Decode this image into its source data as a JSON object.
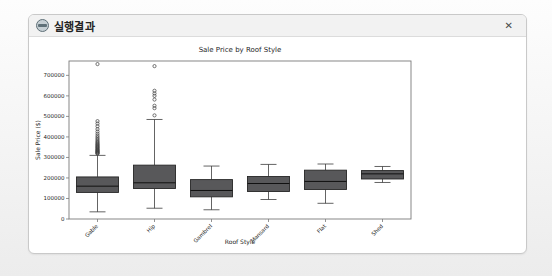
{
  "window": {
    "title": "실행결과",
    "close_glyph": "✕",
    "icon_name": "app-logo-icon"
  },
  "chart_data": {
    "type": "boxplot",
    "title": "Sale Price by Roof Style",
    "xlabel": "Roof Style",
    "ylabel": "Sale Price ($)",
    "categories": [
      "Gable",
      "Hip",
      "Gambrel",
      "Mansard",
      "Flat",
      "Shed"
    ],
    "ylim": [
      0,
      770000
    ],
    "yticks": [
      0,
      100000,
      200000,
      300000,
      400000,
      500000,
      600000,
      700000
    ],
    "grid": false,
    "legend": "none",
    "box_fill_color": "#58585a",
    "box_edge_color": "#262626",
    "median_color": "#111111",
    "whisker_color": "#3c3c3c",
    "axis_color": "#7a7a7a",
    "series": [
      {
        "label": "Gable",
        "whislo": 34900,
        "q1": 129500,
        "med": 160000,
        "q3": 205000,
        "whishi": 310000,
        "outliers": [
          318000,
          320000,
          323000,
          326000,
          328000,
          331000,
          334000,
          337000,
          340000,
          344000,
          348000,
          351000,
          355000,
          359000,
          363000,
          367000,
          372000,
          377000,
          383000,
          390000,
          397000,
          405000,
          415000,
          426000,
          438000,
          452000,
          465000,
          477000,
          755000
        ]
      },
      {
        "label": "Hip",
        "whislo": 52500,
        "q1": 148500,
        "med": 176500,
        "q3": 262500,
        "whishi": 485000,
        "outliers": [
          505000,
          540000,
          552000,
          582000,
          600000,
          612000,
          625000,
          745000
        ]
      },
      {
        "label": "Gambrel",
        "whislo": 45000,
        "q1": 108000,
        "med": 139000,
        "q3": 192000,
        "whishi": 258000,
        "outliers": []
      },
      {
        "label": "Mansard",
        "whislo": 95000,
        "q1": 134000,
        "med": 173000,
        "q3": 207000,
        "whishi": 266000,
        "outliers": []
      },
      {
        "label": "Flat",
        "whislo": 76500,
        "q1": 144000,
        "med": 183000,
        "q3": 238000,
        "whishi": 268000,
        "outliers": []
      },
      {
        "label": "Shed",
        "whislo": 178000,
        "q1": 195000,
        "med": 220000,
        "q3": 236000,
        "whishi": 256000,
        "outliers": []
      }
    ]
  }
}
